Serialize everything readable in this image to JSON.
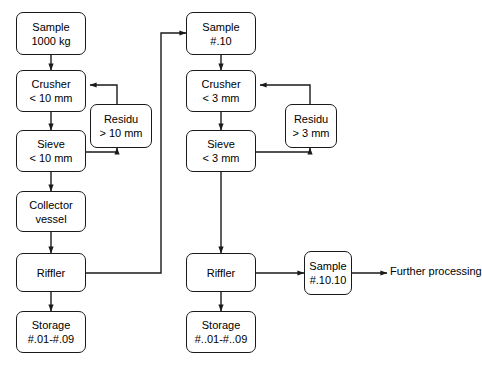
{
  "diagram": {
    "background_color": "#ffffff",
    "line_color": "#1a1a1a",
    "text_color": "#000000",
    "nodes": {
      "sample_1000kg": {
        "line1": "Sample",
        "line2": "1000 kg"
      },
      "crusher_10mm": {
        "line1": "Crusher",
        "line2": "< 10 mm"
      },
      "residu_10mm": {
        "line1": "Residu",
        "line2": "> 10 mm"
      },
      "sieve_10mm": {
        "line1": "Sieve",
        "line2": "< 10 mm"
      },
      "collector_vessel": {
        "line1": "Collector",
        "line2": "vessel"
      },
      "riffler_left": {
        "line1": "Riffler",
        "line2": ""
      },
      "storage_left": {
        "line1": "Storage",
        "line2": "#.01-#.09"
      },
      "sample_10": {
        "line1": "Sample",
        "line2": "#.10"
      },
      "crusher_3mm": {
        "line1": "Crusher",
        "line2": "< 3 mm"
      },
      "residu_3mm": {
        "line1": "Residu",
        "line2": "> 3 mm"
      },
      "sieve_3mm": {
        "line1": "Sieve",
        "line2": "< 3 mm"
      },
      "riffler_right": {
        "line1": "Riffler",
        "line2": ""
      },
      "storage_right": {
        "line1": "Storage",
        "line2": "#..01-#..09"
      },
      "sample_10_10": {
        "line1": "Sample",
        "line2": "#.10.10"
      }
    },
    "labels": {
      "further_processing": {
        "line1": "Further",
        "line2": "processing"
      }
    }
  }
}
